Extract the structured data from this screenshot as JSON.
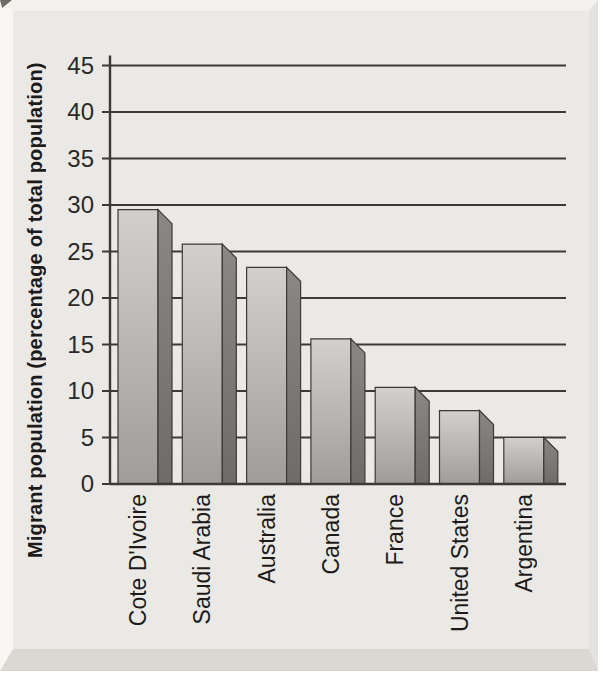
{
  "figure": {
    "panel_background_color": "#ebe9e6",
    "page_color": "#ffffff",
    "line_color": "#3b3a38",
    "text_color": "#1c1b1a",
    "bar_front_top_color": "#d2d0cd",
    "bar_front_bottom_color": "#9f9c99",
    "bar_side_top_color": "#8a8785",
    "bar_side_bottom_color": "#6e6b69"
  },
  "chart_data": {
    "type": "bar",
    "style": "3d-shaded-vertical-bars",
    "title": "",
    "xlabel": "",
    "ylabel": "Migrant population (percentage of total population)",
    "categories": [
      "Cote D'Ivoire",
      "Saudi Arabia",
      "Australia",
      "Canada",
      "France",
      "United States",
      "Argentina"
    ],
    "values": [
      29.5,
      25.8,
      23.3,
      15.6,
      10.4,
      7.9,
      5.0
    ],
    "ylim": [
      0,
      45
    ],
    "ytick_step": 5,
    "yticks": [
      0,
      5,
      10,
      15,
      20,
      25,
      30,
      35,
      40,
      45
    ],
    "grid": "horizontal",
    "legend": "none"
  }
}
